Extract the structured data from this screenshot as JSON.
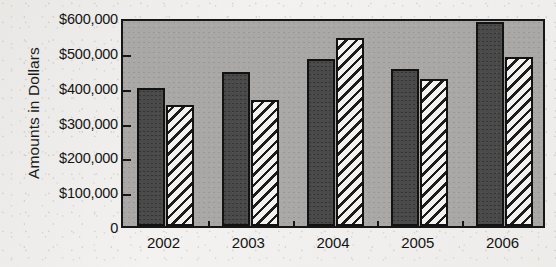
{
  "chart_data": {
    "type": "bar",
    "title": "",
    "subtitle": "",
    "xlabel": "",
    "ylabel": "Amounts in Dollars",
    "categories": [
      "2002",
      "2003",
      "2004",
      "2005",
      "2006"
    ],
    "series": [
      {
        "name": "series-1-solid-dark",
        "values": [
          395000,
          441000,
          479000,
          450000,
          586000
        ]
      },
      {
        "name": "series-2-hatched",
        "values": [
          346000,
          363000,
          539000,
          421000,
          485000
        ]
      }
    ],
    "ylim": [
      0,
      600000
    ],
    "ytick_values": [
      0,
      100000,
      200000,
      300000,
      400000,
      500000,
      600000
    ],
    "ytick_labels": [
      "0",
      "$100,000",
      "$200,000",
      "$300,000",
      "$400,000",
      "$500,000",
      "$600,000"
    ],
    "grid": false,
    "legend": "none",
    "legend_position": "none",
    "annotations": [],
    "colors": {
      "plot_background": "#a9a8a6",
      "page_background": "#f2f1ef",
      "axis": "#161616",
      "series_1_fill": "#4a4a4a",
      "series_2_fill": "#f3f2f0",
      "series_2_hatch": "#1c1c1c",
      "text": "#141414"
    }
  }
}
